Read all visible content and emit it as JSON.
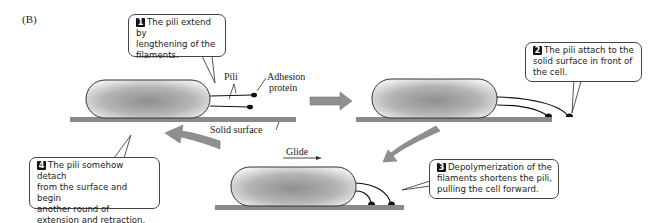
{
  "figure": {
    "panel_label": "(B)",
    "labels": {
      "pili": "Pili",
      "adhesion_protein": "Adhesion protein",
      "adhesion_line1": "Adhesion",
      "adhesion_line2": "protein",
      "solid_surface": "Solid surface",
      "glide": "Glide"
    },
    "steps": [
      {
        "number": "1",
        "text": "The pili extend by lengthening of the filaments.",
        "lines": [
          "The pili extend by",
          "lengthening of the",
          "filaments."
        ]
      },
      {
        "number": "2",
        "text": "The pili attach to the solid surface in front of the cell.",
        "lines": [
          "The pili attach to the",
          "solid surface in front of",
          "the cell."
        ]
      },
      {
        "number": "3",
        "text": "Depolymerization of the filaments shortens the pili, pulling the cell forward.",
        "lines": [
          "Depolymerization of the",
          "filaments shortens the pili,",
          "pulling the cell forward."
        ]
      },
      {
        "number": "4",
        "text": "The pili somehow detach from the surface and begin another round of extension and retraction.",
        "lines": [
          "The pili somehow detach",
          "from the surface and begin",
          "another round of",
          "extension and retraction."
        ]
      }
    ],
    "colors": {
      "surface": "#8a8a8a",
      "arrow": "#8f8f8f",
      "cell_center": "#9a9a9a",
      "cell_edge": "#e6e6e6",
      "outline": "#333333"
    }
  }
}
